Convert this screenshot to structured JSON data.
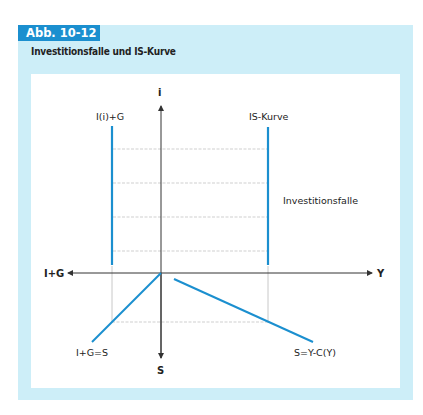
{
  "figure": {
    "tag": "Abb. 10-12",
    "title": "Investitionsfalle und IS-Kurve"
  },
  "colors": {
    "panel_bg": "#cdeef8",
    "tag_bg": "#1b8fcf",
    "curve": "#1b8fcf",
    "axis": "#333333",
    "guide": "#c8c8c8"
  },
  "axes": {
    "top": "i",
    "bottom": "S",
    "left": "I+G",
    "right": "Y"
  },
  "labels": {
    "investment_curve": "I(i)+G",
    "is_curve": "IS-Kurve",
    "trap": "Investitionsfalle",
    "equilibrium_line": "I+G=S",
    "savings_line": "S=Y-C(Y)"
  }
}
